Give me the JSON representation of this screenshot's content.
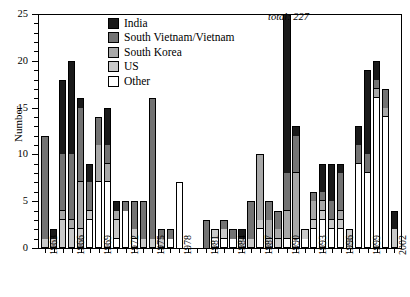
{
  "chart_data": {
    "type": "bar",
    "title": "",
    "subtitle": "",
    "xlabel": "",
    "ylabel": "Number",
    "ylim": [
      0,
      25
    ],
    "yticks": [
      0,
      5,
      10,
      15,
      20,
      25
    ],
    "ytick_labels": [
      "0",
      "5",
      "10",
      "15",
      "20",
      "25"
    ],
    "grid": false,
    "stacked": true,
    "legend_position": "top-center",
    "annotation": "total:  227",
    "legend": [
      "India",
      "South Vietnam/Vietnam",
      "South Korea",
      "US",
      "Other"
    ],
    "colors": {
      "India": "#1a1a1a",
      "South Vietnam/Vietnam": "#737373",
      "South Korea": "#a8a8a8",
      "US": "#c9c9c9",
      "Other": "#ffffff"
    },
    "categories": [
      "1963",
      "1964",
      "1965",
      "1966",
      "1967",
      "1968",
      "1969",
      "1970",
      "1971",
      "1972",
      "1973",
      "1974",
      "1975",
      "1976",
      "1977",
      "1978",
      "1979",
      "1980",
      "1981",
      "1982",
      "1983",
      "1984",
      "1985",
      "1986",
      "1987",
      "1988",
      "1989",
      "1990",
      "1991",
      "1992",
      "1993",
      "1994",
      "1995",
      "1996",
      "1997",
      "1998",
      "1999",
      "2000",
      "2001",
      "2002"
    ],
    "xtick_labels": [
      "1963",
      "1966",
      "1969",
      "1972",
      "1975",
      "1978",
      "1981",
      "1984",
      "1987",
      "1990",
      "1993",
      "1996",
      "1999",
      "2002"
    ],
    "series": [
      {
        "name": "India",
        "values": [
          0,
          1,
          8,
          10,
          1,
          2,
          0,
          4,
          1,
          0,
          0,
          0,
          0,
          0,
          0,
          0,
          0,
          0,
          0,
          0,
          0,
          0,
          1,
          0,
          0,
          0,
          0,
          17,
          1,
          0,
          0,
          3,
          4,
          1,
          0,
          2,
          9,
          2,
          0,
          2
        ]
      },
      {
        "name": "South Vietnam/Vietnam",
        "values": [
          11,
          0,
          6,
          7,
          8,
          3,
          3,
          2,
          0,
          1,
          3,
          4,
          15,
          1,
          1,
          0,
          0,
          0,
          3,
          0,
          1,
          1,
          0,
          4,
          0,
          2,
          2,
          4,
          4,
          0,
          1,
          1,
          2,
          4,
          0,
          2,
          2,
          1,
          2,
          0
        ]
      },
      {
        "name": "South Korea",
        "values": [
          0,
          0,
          1,
          1,
          5,
          0,
          4,
          2,
          1,
          0,
          0,
          0,
          0,
          0,
          0,
          0,
          0,
          0,
          0,
          0,
          0,
          0,
          0,
          0,
          7,
          2,
          1,
          3,
          7,
          0,
          2,
          1,
          0,
          1,
          0,
          0,
          0,
          1,
          1,
          0
        ]
      },
      {
        "name": "US",
        "values": [
          1,
          1,
          3,
          2,
          2,
          1,
          0,
          0,
          2,
          0,
          1,
          1,
          1,
          1,
          0,
          0,
          0,
          0,
          0,
          1,
          1,
          0,
          1,
          1,
          1,
          1,
          1,
          0,
          0,
          1,
          1,
          1,
          1,
          1,
          2,
          0,
          0,
          0,
          0,
          2
        ]
      },
      {
        "name": "Other",
        "values": [
          0,
          0,
          0,
          0,
          0,
          3,
          7,
          7,
          1,
          4,
          1,
          0,
          0,
          0,
          1,
          7,
          0,
          0,
          0,
          1,
          1,
          1,
          0,
          0,
          2,
          0,
          0,
          1,
          1,
          1,
          2,
          3,
          2,
          2,
          0,
          9,
          8,
          16,
          14,
          0
        ]
      }
    ],
    "totals": [
      12,
      2,
      18,
      20,
      16,
      9,
      14,
      15,
      5,
      5,
      5,
      5,
      16,
      2,
      2,
      7,
      0,
      0,
      3,
      2,
      3,
      2,
      2,
      5,
      10,
      5,
      4,
      25,
      13,
      2,
      6,
      9,
      9,
      9,
      2,
      13,
      19,
      20,
      17,
      4
    ]
  }
}
